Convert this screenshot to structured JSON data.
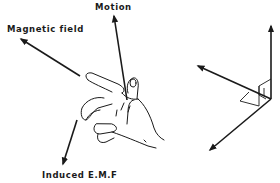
{
  "diagram": {
    "title": "",
    "labels": {
      "motion": "Motion",
      "magnetic_field": "Magnetic field",
      "induced_emf": "Induced E.M.F"
    },
    "colors": {
      "ink": "#1a1a1a",
      "background": "#ffffff"
    },
    "left_figure": {
      "type": "hand-illustration",
      "arrows": [
        {
          "name": "motion",
          "from": [
            127,
            126
          ],
          "to": [
            114,
            15
          ]
        },
        {
          "name": "magnetic-field",
          "from": [
            78,
            74
          ],
          "to": [
            20,
            38
          ]
        },
        {
          "name": "induced-emf",
          "from": [
            76,
            125
          ],
          "to": [
            63,
            165
          ]
        }
      ]
    },
    "right_figure": {
      "type": "orthogonal-axes",
      "origin": [
        271,
        99
      ],
      "arrows": [
        {
          "name": "vertical-axis",
          "to": [
            271,
            25
          ]
        },
        {
          "name": "left-axis",
          "to": [
            198,
            66
          ]
        },
        {
          "name": "down-left-axis",
          "to": [
            210,
            150
          ]
        }
      ],
      "right_angle_markers": 3
    }
  }
}
